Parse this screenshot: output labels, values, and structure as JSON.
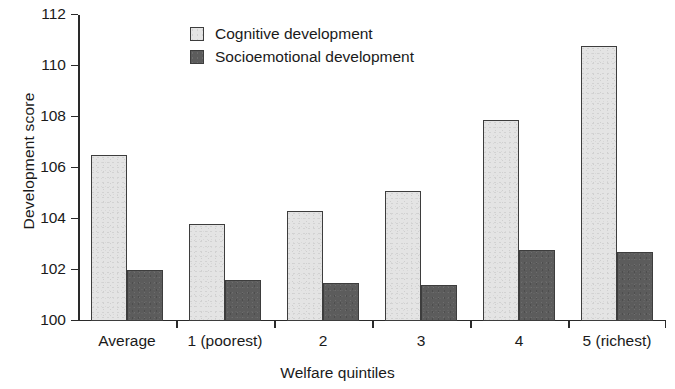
{
  "chart_data": {
    "type": "bar",
    "title": "",
    "xlabel": "Welfare quintiles",
    "ylabel": "Development score",
    "categories": [
      "Average",
      "1 (poorest)",
      "2",
      "3",
      "4",
      "5 (richest)"
    ],
    "series": [
      {
        "name": "Cognitive development",
        "color": "#e4e4e4",
        "values": [
          106.5,
          103.8,
          104.3,
          105.1,
          107.9,
          110.8
        ]
      },
      {
        "name": "Socioemotional development",
        "color": "#5c5c5c",
        "values": [
          102.0,
          101.6,
          101.5,
          101.4,
          102.8,
          102.7
        ]
      }
    ],
    "ylim": [
      100,
      112
    ],
    "yticks": [
      100,
      102,
      104,
      106,
      108,
      110,
      112
    ],
    "ytick_labels": [
      "100",
      "102",
      "104",
      "106",
      "108",
      "110",
      "112"
    ],
    "grid": false,
    "legend_position": "top-center"
  }
}
